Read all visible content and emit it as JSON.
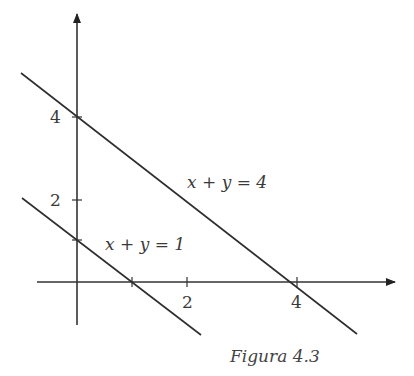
{
  "figure": {
    "caption": "Figura 4.3",
    "x_ticks": [
      {
        "value": 2,
        "label": "2"
      },
      {
        "value": 4,
        "label": "4"
      }
    ],
    "x_unlabeled_ticks": [
      1
    ],
    "y_ticks": [
      {
        "value": 4,
        "label": "4"
      },
      {
        "value": 2,
        "label": "2"
      }
    ],
    "y_unlabeled_ticks": [
      1
    ],
    "lines": [
      {
        "equation": "x + y = 4",
        "eq_parts": [
          "x",
          "+",
          "y",
          "=",
          "4"
        ]
      },
      {
        "equation": "x + y = 1",
        "eq_parts": [
          "x",
          "+",
          "y",
          "=",
          "1"
        ]
      }
    ]
  }
}
